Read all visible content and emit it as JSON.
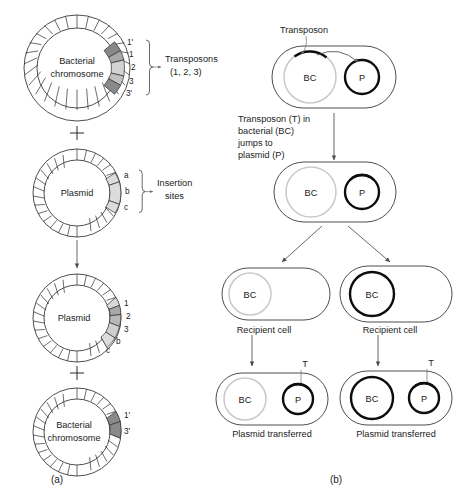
{
  "figure": {
    "panels": [
      {
        "id": "a",
        "label": "(a)"
      },
      {
        "id": "b",
        "label": "(b)"
      }
    ]
  },
  "colors": {
    "outline": "#2e2e2e",
    "dna_thin": "#c9c9c9",
    "dna_thick": "#0d0d0d",
    "seg_dark": "#808080",
    "seg_medium": "#a8a8a8",
    "seg_light": "#cfcfcf",
    "seg_pale": "#e2e2e2",
    "background": "#ffffff"
  },
  "panel_a": {
    "step1": {
      "name": "bacterial-chromosome",
      "label_line1": "Bacterial",
      "label_line2": "chromosome",
      "segment_labels": [
        "1'",
        "1",
        "2",
        "3",
        "3'"
      ],
      "segment_shades": [
        "#888888",
        "#a8a8a8",
        "#d2d2d2",
        "#c2c2c2",
        "#8a8a8a"
      ],
      "annotation_line1": "Transposons",
      "annotation_line2": "(1, 2, 3)"
    },
    "plus1": "+",
    "step2": {
      "name": "plasmid",
      "label": "Plasmid",
      "segment_labels": [
        "a",
        "b",
        "c"
      ],
      "segment_shades": [
        "#dcdcdc",
        "#dcdcdc",
        "#dcdcdc"
      ],
      "annotation_line1": "Insertion",
      "annotation_line2": "sites"
    },
    "step3": {
      "name": "plasmid-with-transposons",
      "label": "Plasmid",
      "segment_labels": [
        "1",
        "2",
        "3",
        "b",
        "c"
      ],
      "segment_shades": [
        "#d8d8d8",
        "#a8a8a8",
        "#b8b8b8",
        "#d0d0d0",
        "#dcdcdc"
      ]
    },
    "plus2": "+",
    "step4": {
      "name": "bacterial-chromosome-residual",
      "label_line1": "Bacterial",
      "label_line2": "chromosome",
      "segment_labels": [
        "1'",
        "3'"
      ],
      "segment_shades": [
        "#8a8a8a",
        "#8a8a8a"
      ]
    }
  },
  "panel_b": {
    "step1": {
      "name": "donor-cell",
      "transposon_label": "Transposon",
      "bc_label": "BC",
      "p_label": "P"
    },
    "caption1": {
      "line1": "Transposon (T) in",
      "line2": "bacterial (BC)",
      "line3": "jumps to",
      "line4": "plasmid (P)"
    },
    "step2": {
      "name": "donor-cell-after-jump",
      "bc_label": "BC",
      "p_label": "P"
    },
    "left_branch": {
      "recipient": {
        "name": "recipient-cell-left",
        "bc_label": "BC",
        "caption": "Recipient cell"
      },
      "result": {
        "name": "recipient-cell-left-transferred",
        "bc_label": "BC",
        "p_label": "P",
        "t_label": "T",
        "caption": "Plasmid transferred"
      }
    },
    "right_branch": {
      "recipient": {
        "name": "recipient-cell-right",
        "bc_label": "BC",
        "caption": "Recipient cell"
      },
      "result": {
        "name": "recipient-cell-right-transferred",
        "bc_label": "BC",
        "p_label": "P",
        "t_label": "T",
        "caption": "Plasmid transferred"
      }
    }
  }
}
